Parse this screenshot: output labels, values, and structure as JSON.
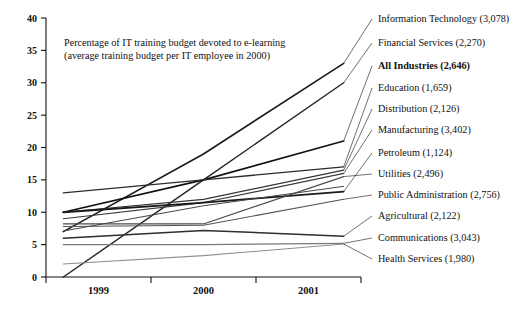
{
  "chart_data": {
    "type": "line",
    "title": "",
    "caption_line1": "Percentage of IT training budget devoted to e-learning",
    "caption_line2": "(average training budget per IT employee in 2000)",
    "xlabel": "",
    "ylabel": "",
    "categories": [
      "1999",
      "2000",
      "2001"
    ],
    "x_tick_labels": [
      "1999",
      "2000",
      "2001"
    ],
    "y_tick_labels": [
      "0",
      "5",
      "10",
      "15",
      "20",
      "25",
      "30",
      "35",
      "40"
    ],
    "ylim": [
      0,
      40
    ],
    "y_tick_step": 5,
    "grid": false,
    "legend_position": "right-labels",
    "series": [
      {
        "name": "Information Technology",
        "value_label": "(3,078)",
        "budget": 3078,
        "bold": false,
        "values": [
          7,
          19,
          33
        ],
        "color": "#1a1a1a",
        "width": 1.6,
        "label_y": 22
      },
      {
        "name": "Financial Services",
        "value_label": "(2,270)",
        "budget": 2270,
        "bold": false,
        "values": [
          0,
          15,
          30
        ],
        "color": "#222222",
        "width": 1.4,
        "label_y": 46
      },
      {
        "name": "All Industries",
        "value_label": "(2,646)",
        "budget": 2646,
        "bold": true,
        "values": [
          10,
          15,
          21
        ],
        "color": "#111111",
        "width": 1.7,
        "label_y": 69
      },
      {
        "name": "Education",
        "value_label": "(1,659)",
        "budget": 1659,
        "bold": false,
        "values": [
          13,
          15,
          17
        ],
        "color": "#2b2b2b",
        "width": 1.3,
        "label_y": 91
      },
      {
        "name": "Distribution",
        "value_label": "(2,126)",
        "budget": 2126,
        "bold": false,
        "values": [
          10,
          12,
          16.5
        ],
        "color": "#333333",
        "width": 1.2,
        "label_y": 112
      },
      {
        "name": "Manufacturing",
        "value_label": "(3,402)",
        "budget": 3402,
        "bold": false,
        "values": [
          9,
          11.5,
          16
        ],
        "color": "#3a3a3a",
        "width": 1.2,
        "label_y": 133
      },
      {
        "name": "Petroleum",
        "value_label": "(1,124)",
        "budget": 1124,
        "bold": false,
        "values": [
          10,
          11.5,
          13.2
        ],
        "color": "#1a1a1a",
        "width": 1.8,
        "label_y": 156
      },
      {
        "name": "Utilities",
        "value_label": "(2,496)",
        "budget": 2496,
        "bold": false,
        "values": [
          8.2,
          8.2,
          15.5
        ],
        "color": "#4a4a4a",
        "width": 1.1,
        "label_y": 177
      },
      {
        "name": "Public Administration",
        "value_label": "(2,756)",
        "budget": 2756,
        "bold": false,
        "values": [
          7.8,
          8,
          12
        ],
        "color": "#555555",
        "width": 1.1,
        "label_y": 198
      },
      {
        "name": "Agricultural",
        "value_label": "(2,122)",
        "budget": 2122,
        "bold": false,
        "values": [
          6,
          7.2,
          6.3
        ],
        "color": "#2f2f2f",
        "width": 1.5,
        "label_y": 219
      },
      {
        "name": "Communications",
        "value_label": "(3,043)",
        "budget": 3043,
        "bold": false,
        "values": [
          5,
          5,
          5.2
        ],
        "color": "#7a7a7a",
        "width": 1.1,
        "label_y": 241
      },
      {
        "name": "Health Services",
        "value_label": "(1,980)",
        "budget": 1980,
        "bold": false,
        "values": [
          2,
          3.3,
          5.1
        ],
        "color": "#8f8f8f",
        "width": 1.1,
        "label_y": 262
      },
      {
        "name": "Extra Trend",
        "value_label": "",
        "budget": 0,
        "bold": false,
        "values": [
          7.1,
          11,
          14
        ],
        "color": "#444444",
        "width": 1.0,
        "label_y": -100
      }
    ]
  },
  "axis": {
    "y_axis_name": "vertical-axis",
    "x_axis_name": "horizontal-axis"
  }
}
